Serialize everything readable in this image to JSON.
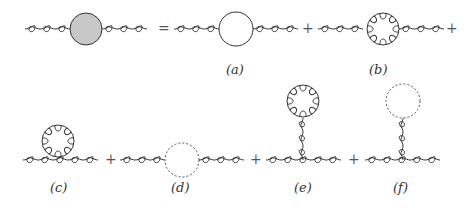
{
  "equation": {
    "lhs": {
      "blob_color": "#c8c8c8"
    },
    "equals": "=",
    "plus": "+"
  },
  "diagrams": [
    {
      "id": "a",
      "label": "(a)",
      "type": "quark-loop"
    },
    {
      "id": "b",
      "label": "(b)",
      "type": "gluon-loop"
    },
    {
      "id": "c",
      "label": "(c)",
      "type": "gluon-tadpole-seagull"
    },
    {
      "id": "d",
      "label": "(d)",
      "type": "ghost-loop"
    },
    {
      "id": "e",
      "label": "(e)",
      "type": "gluon-tadpole"
    },
    {
      "id": "f",
      "label": "(f)",
      "type": "ghost-tadpole"
    }
  ],
  "colors": {
    "line": "#333333",
    "blob": "#c8c8c8",
    "dashed": "#555555"
  }
}
